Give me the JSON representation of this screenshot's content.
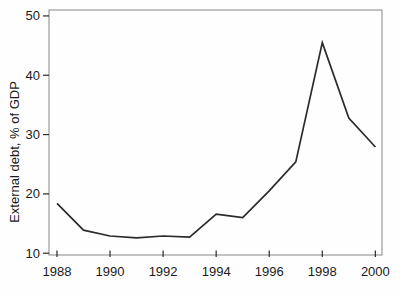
{
  "chart_data": {
    "type": "line",
    "title": "",
    "xlabel": "",
    "ylabel": "External debt, % of GDP",
    "x": [
      1988,
      1989,
      1990,
      1991,
      1992,
      1993,
      1994,
      1995,
      1996,
      1997,
      1998,
      1999,
      2000
    ],
    "series": [
      {
        "name": "External debt, % of GDP",
        "values": [
          18.4,
          13.9,
          12.9,
          12.6,
          12.9,
          12.7,
          16.6,
          16.0,
          20.5,
          25.4,
          45.5,
          32.8,
          27.9
        ]
      }
    ],
    "xticks": [
      1988,
      1990,
      1992,
      1994,
      1996,
      1998,
      2000
    ],
    "yticks": [
      10,
      20,
      30,
      40,
      50
    ],
    "xlim": [
      1987.7,
      2000.25
    ],
    "ylim": [
      9.7,
      51.0
    ],
    "grid": false,
    "legend": "none",
    "line_color": "#2b2b2b",
    "frame_color": "#909090",
    "tick_color": "#2a2a2a",
    "text_color": "#1a1a1a"
  }
}
